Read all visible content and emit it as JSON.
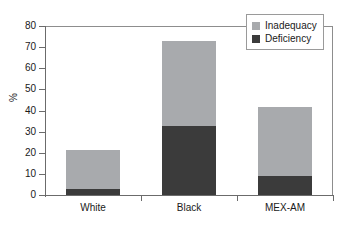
{
  "chart_data": {
    "type": "bar",
    "subtype": "stacked-vertical",
    "title": "",
    "xlabel": "",
    "ylabel": "%",
    "ylim": [
      0,
      80
    ],
    "yticks": [
      0,
      10,
      20,
      30,
      40,
      50,
      60,
      70,
      80
    ],
    "ytick_labels": [
      "0",
      "10",
      "20",
      "30",
      "40",
      "50",
      "60",
      "70",
      "80"
    ],
    "grid": false,
    "legend_position": "top-right",
    "categories": [
      "White",
      "Black",
      "MEX-AM"
    ],
    "series": [
      {
        "name": "Deficiency",
        "color": "#3b3b3b",
        "values": [
          3,
          32.5,
          9
        ]
      },
      {
        "name": "Inadequacy",
        "color": "#a8aaad",
        "values": [
          18.3,
          40.5,
          32.5
        ]
      }
    ],
    "stack_totals": [
      21.3,
      73,
      41.5
    ],
    "legend": [
      {
        "label": "Inadequacy",
        "color": "#a8aaad",
        "swatch": "legend-swatch-inadequacy"
      },
      {
        "label": "Deficiency",
        "color": "#3b3b3b",
        "swatch": "legend-swatch-deficiency"
      }
    ]
  },
  "axes": {
    "y_title": "%",
    "axis_color": "#6b6b6b",
    "frame_color": "#8d8d8d"
  }
}
